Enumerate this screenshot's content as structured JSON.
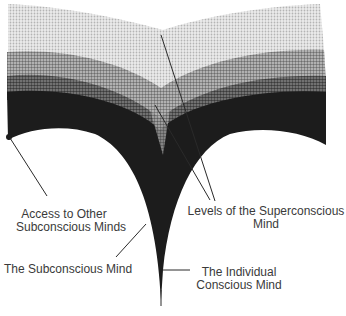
{
  "diagram": {
    "type": "concept-diagram",
    "colors": {
      "background": "#ffffff",
      "superconscious_light": "#d4d4d4",
      "superconscious_mid": "#9a9a9a",
      "superconscious_dark": "#5e5e5e",
      "subconscious": "#1c1c1c",
      "leader_line": "#2a2a2a",
      "text": "#3a3a3a"
    },
    "labels": {
      "access_other": [
        "Access to Other",
        "Subconscious Minds"
      ],
      "levels_superconscious": [
        "Levels of the Superconscious",
        "Mind"
      ],
      "subconscious": "The Subconscious Mind",
      "individual_conscious": [
        "The Individual",
        "Conscious Mind"
      ]
    }
  }
}
